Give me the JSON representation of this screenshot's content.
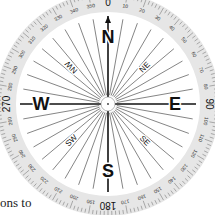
{
  "compass": {
    "center": [
      108,
      104
    ],
    "outer_radius": 112,
    "ring_inner_radius": 92,
    "hub_radius": 7,
    "cardinals": [
      {
        "label": "N",
        "angle": 0
      },
      {
        "label": "E",
        "angle": 90
      },
      {
        "label": "S",
        "angle": 180
      },
      {
        "label": "W",
        "angle": 270
      }
    ],
    "intercardinals": [
      {
        "label": "NE",
        "angle": 45
      },
      {
        "label": "SE",
        "angle": 135
      },
      {
        "label": "SW",
        "angle": 225
      },
      {
        "label": "NW",
        "angle": 315
      }
    ],
    "major_degree_labels": [
      {
        "label": "0",
        "angle": 0
      },
      {
        "label": "90",
        "angle": 90
      },
      {
        "label": "180",
        "angle": 180
      },
      {
        "label": "270",
        "angle": 270
      }
    ],
    "minor_degree_labels": [
      "10",
      "20",
      "30",
      "40",
      "50",
      "60",
      "70",
      "80",
      "100",
      "110",
      "120",
      "130",
      "140",
      "150",
      "160",
      "170",
      "190",
      "200",
      "210",
      "220",
      "230",
      "240",
      "250",
      "260",
      "280",
      "290",
      "300",
      "310",
      "320",
      "330",
      "340",
      "350"
    ],
    "ray_step_degrees": 10,
    "tick_step_degrees": 2,
    "colors": {
      "ring": "#e6e6e6",
      "lines": "#333333",
      "text": "#111111"
    }
  },
  "background_text": {
    "line1": "ons to",
    "line2": "more"
  }
}
